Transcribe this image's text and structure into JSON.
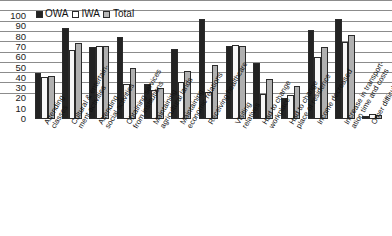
{
  "chart_data": {
    "type": "bar",
    "title": "",
    "xlabel": "",
    "ylabel": "",
    "ylim": [
      0,
      100
    ],
    "yticks": [
      0,
      10,
      20,
      30,
      40,
      50,
      60,
      70,
      80,
      90,
      100
    ],
    "grid": true,
    "legend_position": "top-left",
    "categories": [
      "Attending classes",
      "Cultural & entertainment activities",
      "Attending social activities",
      "Obtaining services from institutions",
      "Maintaining agricultural lands",
      "Maintaining economic relations",
      "Receiving healthcare",
      "Visiting relatives",
      "Had to change workplace",
      "Had to change place of residence",
      "Income decreased",
      "Increase in transportation time and costs",
      "Other difficulties"
    ],
    "category_lines": [
      [
        "Attending",
        "classes"
      ],
      [
        "Cultural & entertain-",
        "ment activities"
      ],
      [
        "Attending",
        "social activities"
      ],
      [
        "Obtaining services",
        "from institutions"
      ],
      [
        "Maintaining",
        "agricultural lands"
      ],
      [
        "Maintaining",
        "economic relations"
      ],
      [
        "Receiving healthcare"
      ],
      [
        "Visiting",
        "relatives"
      ],
      [
        "Had to change",
        "workplace"
      ],
      [
        "Had to change",
        "place of residence"
      ],
      [
        "Income decreased"
      ],
      [
        "Increase in transport-",
        "ation time and costs"
      ],
      [
        "Other difficulties"
      ]
    ],
    "series": [
      {
        "name": "OWA",
        "color": "#232323",
        "values": [
          45,
          88,
          70,
          80,
          34,
          68,
          97,
          71,
          54,
          20,
          86,
          97,
          3
        ]
      },
      {
        "name": "IWA",
        "color": "#f7f7f7",
        "values": [
          41,
          67,
          71,
          34,
          28,
          36,
          26,
          72,
          24,
          23,
          60,
          75,
          5
        ]
      },
      {
        "name": "Total",
        "color": "#b0b0b0",
        "values": [
          42,
          74,
          71,
          50,
          30,
          47,
          52,
          71,
          39,
          32,
          70,
          82,
          4
        ]
      }
    ]
  },
  "legend": {
    "items": [
      {
        "label": "OWA"
      },
      {
        "label": "IWA"
      },
      {
        "label": "Total"
      }
    ]
  }
}
